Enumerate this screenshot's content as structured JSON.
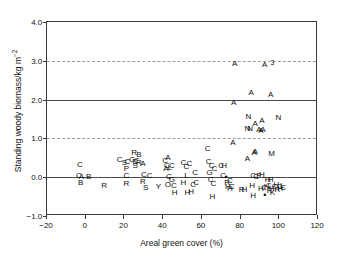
{
  "chart_data": {
    "type": "scatter",
    "title": "",
    "xlabel": "Areal green cover (%)",
    "ylabel": "Standing woody biomass/kg m⁻²",
    "xlim": [
      -20,
      120
    ],
    "ylim": [
      -1.0,
      4.0
    ],
    "xticks": [
      -20,
      0,
      20,
      40,
      60,
      80,
      100,
      120
    ],
    "xtick_labels": [
      "−20",
      "0",
      "20",
      "40",
      "60",
      "80",
      "100",
      "120"
    ],
    "yticks": [
      -1.0,
      0.0,
      1.0,
      2.0,
      3.0,
      4.0
    ],
    "ytick_labels": [
      "−1.0",
      "0.0",
      "1.0",
      "2.0",
      "3.0",
      "4.0"
    ],
    "grid": "horizontal dashed gridlines at y = 0.0, 1.0, 2.0, 3.0",
    "gridlines_y": [
      0.0,
      1.0,
      2.0,
      3.0
    ],
    "legend": "none",
    "marker_style": "letter-coded text markers",
    "marker_labels": [
      "A",
      "B",
      "C",
      "G",
      "H",
      "K",
      "L",
      "M",
      "N",
      "P",
      "R",
      "S",
      "Y",
      "3",
      "•"
    ],
    "points": [
      {
        "x": -3.0,
        "y": 0.32,
        "label": "C"
      },
      {
        "x": -3.5,
        "y": 0.02,
        "label": "C"
      },
      {
        "x": -2.2,
        "y": 0.0,
        "label": "A"
      },
      {
        "x": -2.6,
        "y": -0.16,
        "label": "B"
      },
      {
        "x": 1.5,
        "y": 0.01,
        "label": "B"
      },
      {
        "x": 9.5,
        "y": -0.22,
        "label": "R"
      },
      {
        "x": 17.5,
        "y": 0.45,
        "label": "C"
      },
      {
        "x": 20.0,
        "y": 0.36,
        "label": "S"
      },
      {
        "x": 21.5,
        "y": 0.4,
        "label": "C"
      },
      {
        "x": 21.0,
        "y": 0.22,
        "label": "P"
      },
      {
        "x": 21.0,
        "y": 0.02,
        "label": "C"
      },
      {
        "x": 21.0,
        "y": -0.18,
        "label": "R"
      },
      {
        "x": 25.0,
        "y": 0.62,
        "label": "R"
      },
      {
        "x": 24.0,
        "y": 0.44,
        "label": "G"
      },
      {
        "x": 25.5,
        "y": 0.4,
        "label": "C"
      },
      {
        "x": 27.5,
        "y": 0.58,
        "label": "B"
      },
      {
        "x": 26.5,
        "y": 0.42,
        "label": "C"
      },
      {
        "x": 27.5,
        "y": 0.36,
        "label": "R"
      },
      {
        "x": 25.5,
        "y": 0.3,
        "label": "S"
      },
      {
        "x": 29.5,
        "y": 0.34,
        "label": "A"
      },
      {
        "x": 30.0,
        "y": 0.05,
        "label": "C"
      },
      {
        "x": 29.5,
        "y": -0.12,
        "label": "R"
      },
      {
        "x": 33.0,
        "y": 0.02,
        "label": "C"
      },
      {
        "x": 31.0,
        "y": -0.28,
        "label": "S"
      },
      {
        "x": 37.5,
        "y": -0.24,
        "label": "Y"
      },
      {
        "x": 41.0,
        "y": 0.42,
        "label": "C"
      },
      {
        "x": 42.5,
        "y": 0.5,
        "label": "A"
      },
      {
        "x": 42.0,
        "y": 0.3,
        "label": "C"
      },
      {
        "x": 41.5,
        "y": 0.2,
        "label": "A"
      },
      {
        "x": 43.5,
        "y": 0.24,
        "label": "L"
      },
      {
        "x": 44.5,
        "y": 0.3,
        "label": "C"
      },
      {
        "x": 43.0,
        "y": 0.0,
        "label": "C"
      },
      {
        "x": 44.5,
        "y": -0.08,
        "label": "G"
      },
      {
        "x": 42.5,
        "y": -0.2,
        "label": "O"
      },
      {
        "x": 45.5,
        "y": -0.22,
        "label": "C"
      },
      {
        "x": 46.0,
        "y": -0.4,
        "label": "H"
      },
      {
        "x": 50.5,
        "y": 0.36,
        "label": "C"
      },
      {
        "x": 52.0,
        "y": 0.26,
        "label": "C"
      },
      {
        "x": 53.5,
        "y": 0.34,
        "label": "C"
      },
      {
        "x": 52.0,
        "y": 0.04,
        "label": "L"
      },
      {
        "x": 50.5,
        "y": -0.16,
        "label": "H"
      },
      {
        "x": 52.5,
        "y": -0.4,
        "label": "H"
      },
      {
        "x": 54.5,
        "y": -0.38,
        "label": "H"
      },
      {
        "x": 55.5,
        "y": -0.2,
        "label": "C"
      },
      {
        "x": 56.5,
        "y": 0.12,
        "label": "C"
      },
      {
        "x": 57.0,
        "y": -0.14,
        "label": "C"
      },
      {
        "x": 63.0,
        "y": 0.72,
        "label": "C"
      },
      {
        "x": 63.5,
        "y": 0.38,
        "label": "C"
      },
      {
        "x": 64.0,
        "y": 0.1,
        "label": "G"
      },
      {
        "x": 65.0,
        "y": 0.3,
        "label": "C"
      },
      {
        "x": 66.5,
        "y": 0.22,
        "label": "C"
      },
      {
        "x": 64.5,
        "y": -0.08,
        "label": "C"
      },
      {
        "x": 66.0,
        "y": -0.18,
        "label": "C"
      },
      {
        "x": 65.5,
        "y": -0.5,
        "label": "H"
      },
      {
        "x": 70.0,
        "y": 0.3,
        "label": "C"
      },
      {
        "x": 71.5,
        "y": 0.28,
        "label": "H"
      },
      {
        "x": 71.0,
        "y": 0.02,
        "label": "C"
      },
      {
        "x": 72.5,
        "y": 0.0,
        "label": "•"
      },
      {
        "x": 73.0,
        "y": -0.14,
        "label": "R"
      },
      {
        "x": 74.5,
        "y": -0.1,
        "label": "C"
      },
      {
        "x": 73.5,
        "y": -0.26,
        "label": "H"
      },
      {
        "x": 74.5,
        "y": -0.3,
        "label": "H"
      },
      {
        "x": 75.5,
        "y": -0.24,
        "label": "C"
      },
      {
        "x": 76.0,
        "y": 0.88,
        "label": "A"
      },
      {
        "x": 76.5,
        "y": 1.9,
        "label": "A"
      },
      {
        "x": 77.0,
        "y": 2.92,
        "label": "A"
      },
      {
        "x": 80.5,
        "y": -0.34,
        "label": "R"
      },
      {
        "x": 82.0,
        "y": -0.32,
        "label": "H"
      },
      {
        "x": 83.5,
        "y": 0.48,
        "label": "A"
      },
      {
        "x": 84.0,
        "y": 1.55,
        "label": "N"
      },
      {
        "x": 83.5,
        "y": 1.25,
        "label": "N"
      },
      {
        "x": 85.0,
        "y": 1.25,
        "label": "N"
      },
      {
        "x": 85.5,
        "y": 2.18,
        "label": "A"
      },
      {
        "x": 86.5,
        "y": 0.02,
        "label": "C"
      },
      {
        "x": 87.5,
        "y": 1.38,
        "label": "A"
      },
      {
        "x": 87.0,
        "y": 0.62,
        "label": "A"
      },
      {
        "x": 87.5,
        "y": 0.66,
        "label": "A"
      },
      {
        "x": 86.0,
        "y": -0.22,
        "label": "H"
      },
      {
        "x": 86.5,
        "y": -0.48,
        "label": "H"
      },
      {
        "x": 88.0,
        "y": 0.0,
        "label": "C"
      },
      {
        "x": 89.5,
        "y": 1.22,
        "label": "A"
      },
      {
        "x": 90.5,
        "y": 1.2,
        "label": "A"
      },
      {
        "x": 91.5,
        "y": 1.22,
        "label": "A"
      },
      {
        "x": 91.0,
        "y": 1.45,
        "label": "A"
      },
      {
        "x": 89.5,
        "y": 0.02,
        "label": "P"
      },
      {
        "x": 91.0,
        "y": 0.06,
        "label": "H"
      },
      {
        "x": 92.5,
        "y": 2.88,
        "label": "A"
      },
      {
        "x": 95.5,
        "y": 2.12,
        "label": "A"
      },
      {
        "x": 96.5,
        "y": 2.98,
        "label": "3"
      },
      {
        "x": 96.0,
        "y": 0.6,
        "label": "M"
      },
      {
        "x": 99.5,
        "y": 1.52,
        "label": "N"
      },
      {
        "x": 90.5,
        "y": -0.3,
        "label": "H"
      },
      {
        "x": 92.0,
        "y": -0.28,
        "label": "C"
      },
      {
        "x": 92.5,
        "y": -0.46,
        "label": "•"
      },
      {
        "x": 93.5,
        "y": -0.26,
        "label": "H"
      },
      {
        "x": 94.5,
        "y": -0.22,
        "label": "C"
      },
      {
        "x": 95.0,
        "y": -0.36,
        "label": "R"
      },
      {
        "x": 96.0,
        "y": -0.3,
        "label": "H"
      },
      {
        "x": 96.5,
        "y": -0.4,
        "label": "K"
      },
      {
        "x": 97.5,
        "y": -0.26,
        "label": "C"
      },
      {
        "x": 98.5,
        "y": -0.2,
        "label": "H"
      },
      {
        "x": 99.0,
        "y": -0.34,
        "label": "R"
      },
      {
        "x": 100.0,
        "y": -0.24,
        "label": "C"
      },
      {
        "x": 100.5,
        "y": -0.3,
        "label": "H"
      },
      {
        "x": 101.5,
        "y": -0.22,
        "label": "L"
      },
      {
        "x": 102.0,
        "y": -0.28,
        "label": "C"
      },
      {
        "x": 94.0,
        "y": -0.06,
        "label": "H"
      },
      {
        "x": 95.5,
        "y": -0.08,
        "label": "H"
      }
    ]
  }
}
